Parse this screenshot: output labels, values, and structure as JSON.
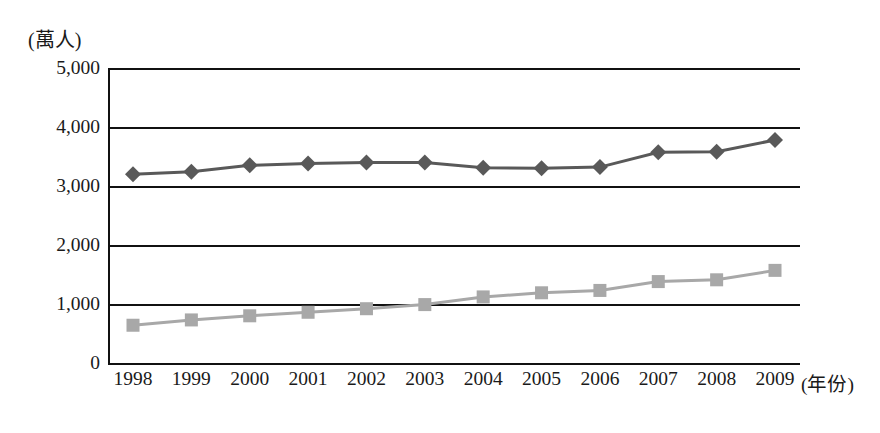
{
  "chart_data": {
    "type": "line",
    "title": "",
    "subtitle": "",
    "xlabel": "(年份)",
    "ylabel": "(萬人)",
    "ylim": [
      0,
      5000
    ],
    "ytick_labels": [
      "0",
      "1,000",
      "2,000",
      "3,000",
      "4,000",
      "5,000"
    ],
    "ytick_values": [
      0,
      1000,
      2000,
      3000,
      4000,
      5000
    ],
    "grid": "horizontal",
    "legend": "none",
    "categories": [
      "1998",
      "1999",
      "2000",
      "2001",
      "2002",
      "2003",
      "2004",
      "2005",
      "2006",
      "2007",
      "2008",
      "2009"
    ],
    "series": [
      {
        "name": "upper-series",
        "marker": "diamond",
        "color": "#595959",
        "values": [
          3200,
          3240,
          3350,
          3380,
          3400,
          3400,
          3310,
          3300,
          3320,
          3570,
          3580,
          3780
        ]
      },
      {
        "name": "lower-series",
        "marker": "square",
        "color": "#a8a8a8",
        "values": [
          640,
          730,
          800,
          860,
          920,
          990,
          1120,
          1190,
          1230,
          1380,
          1410,
          1570
        ]
      }
    ]
  },
  "axis": {
    "y_unit_label": "(萬人)",
    "x_unit_label": "(年份)"
  },
  "colors": {
    "axis": "#111111",
    "upper_series": "#595959",
    "lower_series": "#a8a8a8",
    "background": "#ffffff"
  }
}
